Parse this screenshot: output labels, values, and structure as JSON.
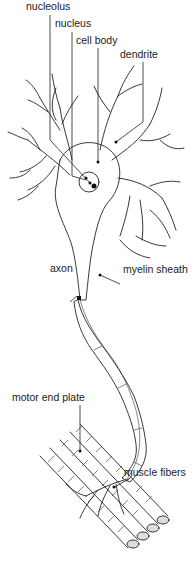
{
  "figure": {
    "labels": {
      "nucleolus": "nucleolus",
      "nucleus": "nucleus",
      "cell_body": "cell body",
      "dendrite": "dendrite",
      "axon": "axon",
      "myelin_sheath": "myelin sheath",
      "motor_end_plate": "motor end plate",
      "muscle_fibers": "muscle fibers"
    },
    "colors": {
      "ink": "#222222",
      "fill_light": "#f2f2f2",
      "myelin_fill": "#e6e6e6",
      "background": "#ffffff"
    }
  }
}
